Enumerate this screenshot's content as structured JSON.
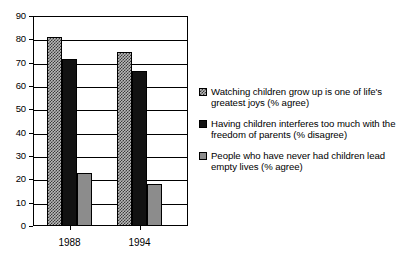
{
  "chart_data": {
    "type": "bar",
    "title": "",
    "xlabel": "",
    "ylabel": "",
    "ylim": [
      0,
      90
    ],
    "yticks": [
      0,
      10,
      20,
      30,
      40,
      50,
      60,
      70,
      80,
      90
    ],
    "grid": true,
    "legend_position": "right",
    "categories": [
      "1988",
      "1994"
    ],
    "series": [
      {
        "name": "Watching children grow up is one of life's greatest joys (% agree)",
        "values": [
          81,
          74.5
        ],
        "swatch": "hatched",
        "color": "#b9b9b9"
      },
      {
        "name": "Having children interferes too much with the freedom of parents (% disagree)",
        "values": [
          71.5,
          66.5
        ],
        "swatch": "solid-black",
        "color": "#121212"
      },
      {
        "name": "People who have never had children lead empty lives (% agree)",
        "values": [
          22.7,
          17.8
        ],
        "swatch": "grey",
        "color": "#8c8c8c"
      }
    ]
  },
  "axis": {
    "y_tick_labels": [
      "90",
      "80",
      "70",
      "60",
      "50",
      "40",
      "30",
      "20",
      "10",
      "0"
    ],
    "x_tick_labels": [
      "1988",
      "1994"
    ]
  },
  "legend": {
    "entries": [
      {
        "label": "Watching children grow up is one of life's greatest joys (% agree)"
      },
      {
        "label": "Having children interferes too much with the freedom of parents (% disagree)"
      },
      {
        "label": "People who have never had children lead empty lives (% agree)"
      }
    ]
  }
}
